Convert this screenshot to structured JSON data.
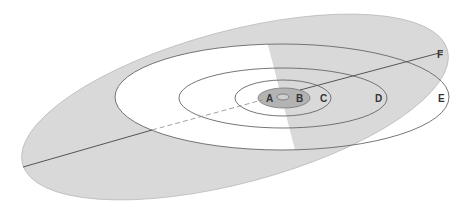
{
  "diagram": {
    "type": "orbital-ellipses",
    "labels": {
      "A": "A",
      "B": "B",
      "C": "C",
      "D": "D",
      "E": "E",
      "F": "F"
    },
    "colors": {
      "background": "#ffffff",
      "outer_plane_fill": "#d9d9d9",
      "inner_core_fill": "#b3b3b3",
      "line": "#555555",
      "white_region": "#ffffff"
    }
  }
}
